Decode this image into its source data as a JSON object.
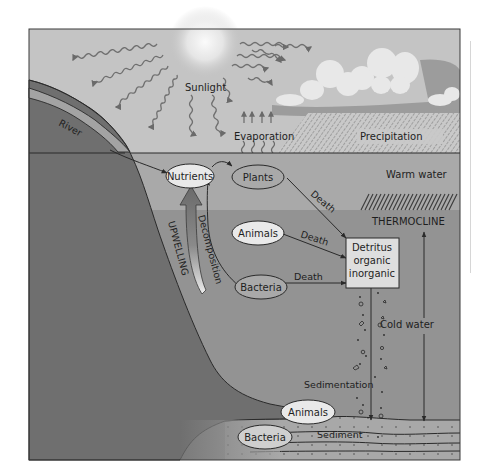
{
  "diagram": {
    "colors": {
      "sky": "#c4c4c4",
      "sun_glow": "#f4f4f4",
      "cloud": "#e8e8e8",
      "cloud_shadow": "#9c9c9c",
      "warm_water": "#a9a9a9",
      "cold_water": "#939393",
      "land": "#6f6f6f",
      "river": "#a3a3a3",
      "sediment": "#a8a8a8",
      "node_fill": "#e9e9e9",
      "detritus_fill": "#dedede",
      "line": "#2a2a2a",
      "frame": "#3a3a3a"
    },
    "atmosphere": {
      "sunlight_label": "Sunlight",
      "evaporation_label": "Evaporation",
      "precipitation_label": "Precipitation",
      "river_label": "River"
    },
    "water_layers": {
      "warm_label": "Warm water",
      "thermocline_label": "THERMOCLINE",
      "cold_label": "Cold water"
    },
    "nodes": {
      "nutrients": "Nutrients",
      "plants": "Plants",
      "animals_mid": "Animals",
      "bacteria_mid": "Bacteria",
      "detritus": [
        "Detritus",
        "organic",
        "inorganic"
      ],
      "animals_floor": "Animals",
      "bacteria_floor": "Bacteria"
    },
    "flows": {
      "plants_death": "Death",
      "animals_death": "Death",
      "bacteria_death": "Death",
      "decomposition": "Decomposition",
      "upwelling": "UPWELLING",
      "sedimentation": "Sedimentation",
      "sediment": "Sediment"
    }
  }
}
